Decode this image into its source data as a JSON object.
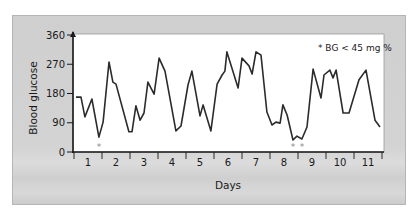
{
  "chart_data": {
    "type": "line",
    "title": "",
    "xlabel": "Days",
    "ylabel": "Blood glucose",
    "ylim": [
      0,
      360
    ],
    "xlim": [
      0,
      11
    ],
    "yticks": [
      0,
      90,
      180,
      270,
      360
    ],
    "yticks_labels": [
      "0",
      "90",
      "180",
      "270",
      "360"
    ],
    "xtick_labels": [
      "1",
      "2",
      "3",
      "4",
      "5",
      "6",
      "7",
      "8",
      "9",
      "10",
      "11"
    ],
    "grid": false,
    "legend": null,
    "annotation": "* BG < 45 mg %",
    "hypoglycemia_markers_day": [
      0.89,
      7.82,
      8.14
    ],
    "series": [
      {
        "name": "Blood glucose",
        "color": "#2b2b2b",
        "x": [
          0.07,
          0.25,
          0.39,
          0.64,
          0.89,
          1.04,
          1.25,
          1.39,
          1.5,
          1.96,
          2.07,
          2.21,
          2.36,
          2.5,
          2.64,
          2.86,
          3.04,
          3.25,
          3.64,
          3.82,
          4.07,
          4.21,
          4.5,
          4.61,
          4.89,
          5.11,
          5.29,
          5.39,
          5.46,
          5.86,
          6.0,
          6.25,
          6.36,
          6.5,
          6.68,
          6.89,
          7.07,
          7.21,
          7.36,
          7.46,
          7.61,
          7.82,
          7.96,
          8.14,
          8.32,
          8.54,
          8.82,
          8.93,
          9.14,
          9.25,
          9.36,
          9.61,
          9.82,
          10.18,
          10.43,
          10.75,
          10.93
        ],
        "values": [
          169,
          169,
          108,
          163,
          46,
          92,
          277,
          215,
          209,
          62,
          62,
          142,
          98,
          120,
          215,
          178,
          289,
          249,
          65,
          80,
          206,
          249,
          111,
          145,
          65,
          209,
          237,
          249,
          308,
          197,
          289,
          265,
          240,
          308,
          298,
          123,
          83,
          92,
          89,
          145,
          114,
          37,
          49,
          40,
          77,
          255,
          166,
          237,
          252,
          228,
          252,
          120,
          120,
          222,
          252,
          98,
          77
        ]
      }
    ]
  }
}
